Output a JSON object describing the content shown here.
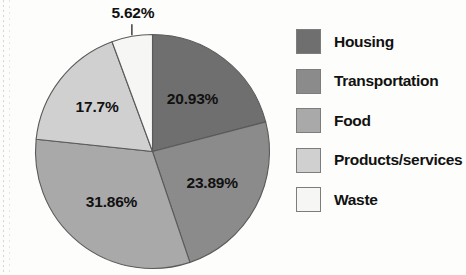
{
  "chart_data": {
    "type": "pie",
    "title": "",
    "subtitle": "",
    "xlabel": "",
    "ylabel": "",
    "grid": false,
    "legend_position": "right",
    "units": "percent",
    "start_angle_deg": 0,
    "direction": "clockwise",
    "categories": [
      "Housing",
      "Transportation",
      "Food",
      "Products/services",
      "Waste"
    ],
    "values": [
      20.93,
      23.89,
      31.86,
      17.7,
      5.62
    ],
    "labels": [
      "20.93%",
      "23.89%",
      "31.86%",
      "17.7%",
      "5.62%"
    ],
    "colors": [
      "#6f6f6f",
      "#8b8b8b",
      "#a9a9a9",
      "#d0d0d0",
      "#f6f6f4"
    ],
    "slices": [
      {
        "name": "Housing",
        "value": 20.93,
        "label": "20.93%",
        "color": "#6f6f6f",
        "label_placement": "inside"
      },
      {
        "name": "Transportation",
        "value": 23.89,
        "label": "23.89%",
        "color": "#8b8b8b",
        "label_placement": "inside"
      },
      {
        "name": "Food",
        "value": 31.86,
        "label": "31.86%",
        "color": "#a9a9a9",
        "label_placement": "inside"
      },
      {
        "name": "Products/services",
        "value": 17.7,
        "label": "17.7%",
        "color": "#d0d0d0",
        "label_placement": "inside"
      },
      {
        "name": "Waste",
        "value": 5.62,
        "label": "5.62%",
        "color": "#f6f6f4",
        "label_placement": "callout-above"
      }
    ]
  },
  "legend": {
    "items": [
      {
        "label": "Housing",
        "color": "#6f6f6f"
      },
      {
        "label": "Transportation",
        "color": "#8b8b8b"
      },
      {
        "label": "Food",
        "color": "#a9a9a9"
      },
      {
        "label": "Products/services",
        "color": "#d0d0d0"
      },
      {
        "label": "Waste",
        "color": "#f6f6f4"
      }
    ]
  },
  "style": {
    "background": "#fdfdfb",
    "outline": "#5a5a5a",
    "text": "#111111"
  }
}
